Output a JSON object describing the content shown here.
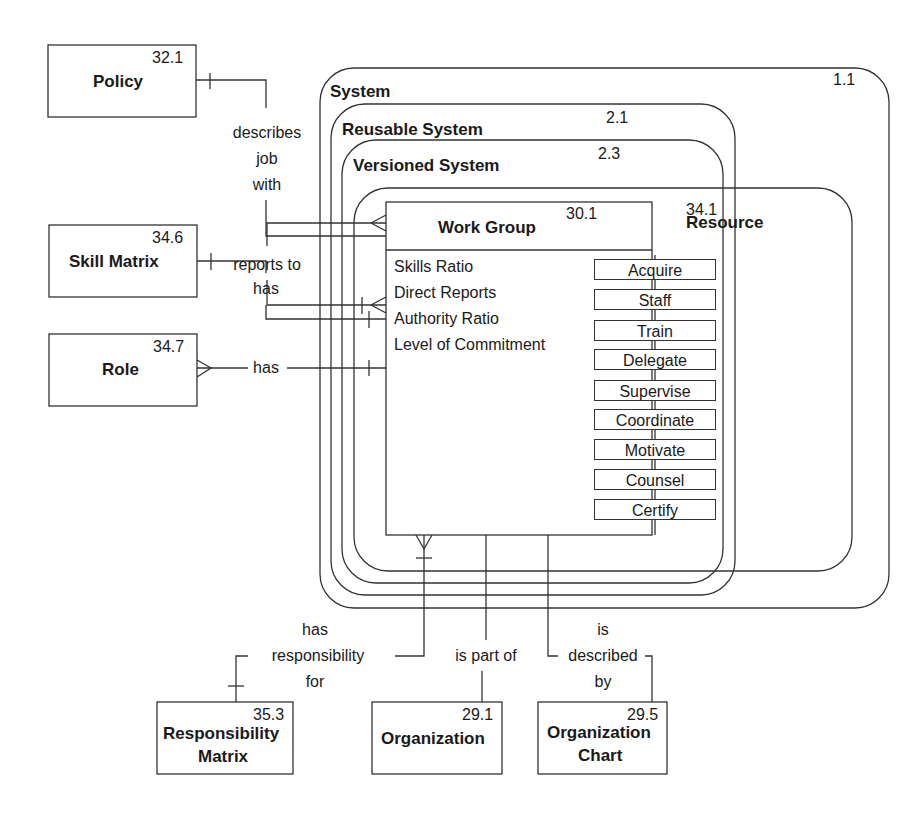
{
  "containers": [
    {
      "name": "System",
      "id": "1.1"
    },
    {
      "name": "Reusable System",
      "id": "2.1"
    },
    {
      "name": "Versioned System",
      "id": "2.3"
    },
    {
      "name": "Resource",
      "id": "34.1"
    }
  ],
  "work_group": {
    "name": "Work Group",
    "id": "30.1",
    "attributes": [
      "Skills Ratio",
      "Direct Reports",
      "Authority Ratio",
      "Level of Commitment"
    ],
    "operations": [
      "Acquire",
      "Staff",
      "Train",
      "Delegate",
      "Supervise",
      "Coordinate",
      "Motivate",
      "Counsel",
      "Certify"
    ]
  },
  "entities": {
    "policy": {
      "name": "Policy",
      "id": "32.1"
    },
    "skill_matrix": {
      "name": "Skill Matrix",
      "id": "34.6"
    },
    "role": {
      "name": "Role",
      "id": "34.7"
    },
    "responsibility_matrix": {
      "name_line1": "Responsibility",
      "name_line2": "Matrix",
      "id": "35.3"
    },
    "organization": {
      "name": "Organization",
      "id": "29.1"
    },
    "organization_chart": {
      "name_line1": "Organization",
      "name_line2": "Chart",
      "id": "29.5"
    }
  },
  "relationships": {
    "policy": [
      "describes",
      "job",
      "with"
    ],
    "skill_matrix": "has",
    "role": "has",
    "reports_to": "reports to",
    "responsibility": [
      "has",
      "responsibility",
      "for"
    ],
    "organization": "is part of",
    "organization_chart": [
      "is",
      "described",
      "by"
    ]
  }
}
